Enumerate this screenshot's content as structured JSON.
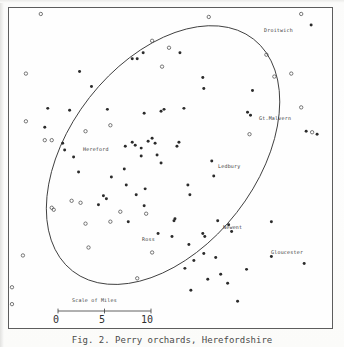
{
  "figure": {
    "kind": "distribution-dot-map",
    "caption": "Fig. 2.  Perry orchards, Herefordshire"
  },
  "map": {
    "frame": {
      "x": 8,
      "y": 7,
      "width": 325,
      "height": 322
    },
    "boundary": {
      "name": "study-area-ellipse",
      "cx": 163,
      "cy": 155,
      "rx": 148,
      "ry": 94,
      "rotation_deg": -52
    },
    "places": [
      {
        "name": "Droitwich",
        "label": "Droitwich",
        "lx": 263,
        "ly": 27,
        "px": 312,
        "py": 24
      },
      {
        "name": "Gt.Malvern",
        "label": "Gt.Malvern",
        "lx": 258,
        "ly": 115,
        "px": 251,
        "py": 115
      },
      {
        "name": "Hereford",
        "label": "Hereford",
        "lx": 82,
        "ly": 146,
        "px": 78,
        "py": 152
      },
      {
        "name": "Ledbury",
        "label": "Ledbury",
        "lx": 217,
        "ly": 163,
        "px": 212,
        "py": 161
      },
      {
        "name": "Newent",
        "label": "Newent",
        "lx": 222,
        "ly": 224,
        "px": 218,
        "py": 221
      },
      {
        "name": "Ross",
        "label": "Ross",
        "lx": 141,
        "ly": 236,
        "px": 158,
        "py": 234
      },
      {
        "name": "Gloucester",
        "label": "Gloucester",
        "lx": 270,
        "ly": 249,
        "px": 272,
        "py": 257
      }
    ],
    "legend_note": "filled dots and open circles mark recorded sites"
  },
  "scale": {
    "title": "Scale of Miles",
    "unit": "miles",
    "ticks": [
      "0",
      "5",
      "10"
    ],
    "tick_values": [
      0,
      5,
      10
    ],
    "bar_length_px": 95
  },
  "chart_data": {
    "type": "scatter",
    "xlabel": "",
    "ylabel": "",
    "grid": false,
    "legend": "none",
    "coordinate_space": "pixels within map frame (344x347 screenshot coords)",
    "series": [
      {
        "name": "filled-site",
        "marker": "filled-dot",
        "color": "#2b2b2b",
        "points": [
          [
            143,
            52
          ],
          [
            137,
            58
          ],
          [
            132,
            58
          ],
          [
            79,
            71
          ],
          [
            91,
            86
          ],
          [
            47,
            108
          ],
          [
            69,
            110
          ],
          [
            107,
            109
          ],
          [
            161,
            111
          ],
          [
            164,
            109
          ],
          [
            184,
            108
          ],
          [
            180,
            52
          ],
          [
            204,
            88
          ],
          [
            203,
            77
          ],
          [
            44,
            127
          ],
          [
            62,
            143
          ],
          [
            64,
            150
          ],
          [
            132,
            142
          ],
          [
            135,
            145
          ],
          [
            148,
            141
          ],
          [
            152,
            138
          ],
          [
            155,
            143
          ],
          [
            141,
            148
          ],
          [
            125,
            146
          ],
          [
            179,
            142
          ],
          [
            177,
            146
          ],
          [
            141,
            156
          ],
          [
            124,
            169
          ],
          [
            73,
            157
          ],
          [
            78,
            172
          ],
          [
            103,
            196
          ],
          [
            106,
            199
          ],
          [
            111,
            177
          ],
          [
            98,
            205
          ],
          [
            126,
            185
          ],
          [
            157,
            155
          ],
          [
            136,
            195
          ],
          [
            145,
            189
          ],
          [
            188,
            185
          ],
          [
            144,
            206
          ],
          [
            161,
            163
          ],
          [
            175,
            219
          ],
          [
            128,
            222
          ],
          [
            174,
            221
          ],
          [
            190,
            195
          ],
          [
            172,
            237
          ],
          [
            158,
            234
          ],
          [
            203,
            234
          ],
          [
            214,
            176
          ],
          [
            229,
            225
          ],
          [
            248,
            112
          ],
          [
            251,
            115
          ],
          [
            212,
            161
          ],
          [
            218,
            221
          ],
          [
            205,
            237
          ],
          [
            272,
            257
          ],
          [
            232,
            232
          ],
          [
            272,
            222
          ],
          [
            305,
            264
          ],
          [
            247,
            270
          ],
          [
            189,
            245
          ],
          [
            194,
            261
          ],
          [
            204,
            254
          ],
          [
            216,
            258
          ],
          [
            185,
            269
          ],
          [
            221,
            275
          ],
          [
            228,
            284
          ],
          [
            238,
            302
          ],
          [
            208,
            280
          ],
          [
            191,
            291
          ],
          [
            253,
            90
          ],
          [
            307,
            131
          ],
          [
            312,
            24
          ],
          [
            318,
            134
          ],
          [
            144,
            113
          ]
        ]
      },
      {
        "name": "open-site",
        "marker": "open-circle",
        "color": "#4a4a4a",
        "points": [
          [
            40,
            13
          ],
          [
            209,
            16
          ],
          [
            302,
            13
          ],
          [
            152,
            40
          ],
          [
            169,
            47
          ],
          [
            267,
            54
          ],
          [
            25,
            73
          ],
          [
            162,
            66
          ],
          [
            275,
            76
          ],
          [
            292,
            73
          ],
          [
            25,
            121
          ],
          [
            85,
            131
          ],
          [
            110,
            125
          ],
          [
            44,
            140
          ],
          [
            51,
            140
          ],
          [
            302,
            107
          ],
          [
            313,
            132
          ],
          [
            3,
            133
          ],
          [
            51,
            208
          ],
          [
            71,
            201
          ],
          [
            80,
            203
          ],
          [
            120,
            212
          ],
          [
            146,
            214
          ],
          [
            53,
            210
          ],
          [
            88,
            248
          ],
          [
            22,
            256
          ],
          [
            11,
            288
          ],
          [
            11,
            305
          ],
          [
            137,
            279
          ],
          [
            152,
            253
          ],
          [
            85,
            224
          ],
          [
            110,
            222
          ],
          [
            250,
            134
          ]
        ]
      }
    ]
  }
}
